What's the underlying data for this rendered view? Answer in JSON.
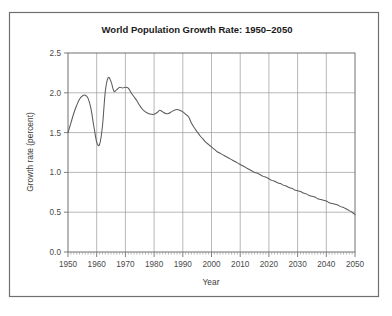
{
  "chart_data": {
    "type": "line",
    "title": "World Population Growth Rate: 1950–2050",
    "xlabel": "Year",
    "ylabel": "Growth rate (percent)",
    "xlim": [
      1950,
      2050
    ],
    "ylim": [
      0.0,
      2.5
    ],
    "grid": true,
    "legend": "none",
    "xticks": [
      1950,
      1960,
      1970,
      1980,
      1990,
      2000,
      2010,
      2020,
      2030,
      2040,
      2050
    ],
    "xtick_labels": [
      "1950",
      "1960",
      "1970",
      "1980",
      "1990",
      "2000",
      "2010",
      "2020",
      "2030",
      "2040",
      "2050"
    ],
    "xtick_minor_step": 1,
    "yticks": [
      0.0,
      0.5,
      1.0,
      1.5,
      2.0,
      2.5
    ],
    "ytick_labels": [
      "0.0",
      "0.5",
      "1.0",
      "1.5",
      "2.0",
      "2.5"
    ],
    "series": [
      {
        "name": "World population growth rate",
        "color": "#5a5a5a",
        "x": [
          1950,
          1951,
          1952,
          1953,
          1954,
          1955,
          1956,
          1957,
          1958,
          1959,
          1960,
          1961,
          1962,
          1963,
          1964,
          1965,
          1966,
          1967,
          1968,
          1969,
          1970,
          1971,
          1972,
          1973,
          1974,
          1975,
          1976,
          1977,
          1978,
          1979,
          1980,
          1981,
          1982,
          1983,
          1984,
          1985,
          1986,
          1987,
          1988,
          1989,
          1990,
          1991,
          1992,
          1993,
          1994,
          1995,
          1996,
          1997,
          1998,
          1999,
          2000,
          2001,
          2002,
          2003,
          2004,
          2005,
          2006,
          2007,
          2008,
          2009,
          2010,
          2011,
          2012,
          2013,
          2014,
          2015,
          2016,
          2017,
          2018,
          2019,
          2020,
          2021,
          2022,
          2023,
          2024,
          2025,
          2026,
          2027,
          2028,
          2029,
          2030,
          2031,
          2032,
          2033,
          2034,
          2035,
          2036,
          2037,
          2038,
          2039,
          2040,
          2041,
          2042,
          2043,
          2044,
          2045,
          2046,
          2047,
          2048,
          2049,
          2050
        ],
        "y": [
          1.5,
          1.62,
          1.74,
          1.84,
          1.92,
          1.96,
          1.97,
          1.93,
          1.8,
          1.58,
          1.38,
          1.35,
          1.58,
          2.02,
          2.19,
          2.14,
          2.02,
          2.04,
          2.07,
          2.06,
          2.07,
          2.06,
          2.0,
          1.95,
          1.9,
          1.84,
          1.79,
          1.76,
          1.74,
          1.73,
          1.73,
          1.75,
          1.78,
          1.76,
          1.74,
          1.74,
          1.76,
          1.78,
          1.79,
          1.78,
          1.76,
          1.73,
          1.7,
          1.62,
          1.56,
          1.51,
          1.46,
          1.42,
          1.38,
          1.35,
          1.32,
          1.29,
          1.26,
          1.24,
          1.22,
          1.2,
          1.18,
          1.16,
          1.14,
          1.12,
          1.1,
          1.08,
          1.06,
          1.04,
          1.02,
          1.0,
          0.99,
          0.97,
          0.95,
          0.94,
          0.92,
          0.9,
          0.89,
          0.87,
          0.86,
          0.84,
          0.83,
          0.81,
          0.8,
          0.78,
          0.77,
          0.76,
          0.74,
          0.73,
          0.71,
          0.7,
          0.69,
          0.67,
          0.66,
          0.65,
          0.64,
          0.62,
          0.61,
          0.6,
          0.59,
          0.57,
          0.56,
          0.54,
          0.52,
          0.5,
          0.47
        ]
      }
    ],
    "annotations": []
  },
  "colors": {
    "line": "#5a5a5a",
    "grid": "#9a9a9a",
    "axis": "#707070",
    "frame": "#6f6f6f",
    "title_text": "#1a1a1a",
    "label_text": "#3a3a3a",
    "background": "#ffffff"
  }
}
